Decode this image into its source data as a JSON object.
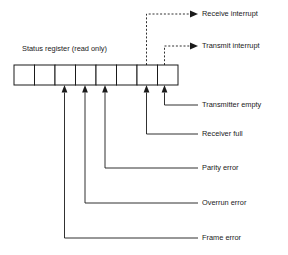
{
  "diagram": {
    "title": "Status register (read only)",
    "register": {
      "bit_count": 8,
      "x": 14,
      "y": 65,
      "width": 164,
      "height": 20,
      "cell_width": 20.5
    },
    "colors": {
      "stroke": "#1a1a1a",
      "fill": "#ffffff",
      "background": "#ffffff"
    },
    "top_callouts": [
      {
        "label": "Receive interrupt",
        "bit_index": 6,
        "line_style": "dashed",
        "arrow": "solid-triangle",
        "stub_x": 146.5,
        "rail_y": 14,
        "text_x": 202,
        "text_y": 14
      },
      {
        "label": "Transmit interrupt",
        "bit_index": 7,
        "line_style": "dashed",
        "arrow": "solid-triangle",
        "stub_x": 164.5,
        "rail_y": 46,
        "text_x": 202,
        "text_y": 46
      }
    ],
    "bottom_callouts": [
      {
        "label": "Transmitter empty",
        "bit_index": 7,
        "line_style": "solid",
        "arrow": "solid-triangle-up",
        "stub_x": 164.5,
        "rail_y": 105,
        "text_x": 202,
        "text_y": 105
      },
      {
        "label": "Receiver full",
        "bit_index": 6,
        "line_style": "solid",
        "arrow": "solid-triangle-up",
        "stub_x": 146.5,
        "rail_y": 134,
        "text_x": 202,
        "text_y": 134
      },
      {
        "label": "Parity error",
        "bit_index": 4,
        "line_style": "solid",
        "arrow": "solid-triangle-up",
        "stub_x": 105,
        "rail_y": 168,
        "text_x": 202,
        "text_y": 168
      },
      {
        "label": "Overrun error",
        "bit_index": 3,
        "line_style": "solid",
        "arrow": "solid-triangle-up",
        "stub_x": 85,
        "rail_y": 203,
        "text_x": 202,
        "text_y": 203
      },
      {
        "label": "Frame error",
        "bit_index": 2,
        "line_style": "solid",
        "arrow": "solid-triangle-up",
        "stub_x": 64.5,
        "rail_y": 238,
        "text_x": 202,
        "text_y": 238
      }
    ]
  }
}
